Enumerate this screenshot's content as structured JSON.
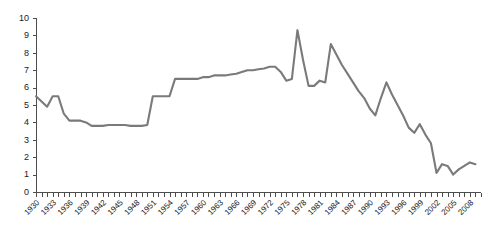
{
  "chart_data": {
    "type": "line",
    "title": "",
    "subtitle": "",
    "xlabel": "",
    "ylabel": "",
    "ylim": [
      0,
      10
    ],
    "xlim": [
      1930,
      2010
    ],
    "grid": false,
    "legend": null,
    "y_ticks": [
      0,
      1,
      2,
      3,
      4,
      5,
      6,
      7,
      8,
      9,
      10
    ],
    "x_tick_labels": [
      "1930",
      "1933",
      "1936",
      "1939",
      "1942",
      "1945",
      "1948",
      "1951",
      "1954",
      "1957",
      "1960",
      "1963",
      "1966",
      "1969",
      "1972",
      "1975",
      "1978",
      "1981",
      "1984",
      "1987",
      "1990",
      "1993",
      "1996",
      "1999",
      "2002",
      "2005",
      "2008"
    ],
    "x_tick_label_step": 3,
    "x_minor_tick_step": 1,
    "line_color": "#7a7a7a",
    "axis_color": "#4d4d4d",
    "series": [
      {
        "name": "series-1",
        "x": [
          1930,
          1931,
          1932,
          1933,
          1934,
          1935,
          1936,
          1937,
          1938,
          1939,
          1940,
          1941,
          1942,
          1943,
          1944,
          1945,
          1946,
          1947,
          1948,
          1949,
          1950,
          1951,
          1952,
          1953,
          1954,
          1955,
          1956,
          1957,
          1958,
          1959,
          1960,
          1961,
          1962,
          1963,
          1964,
          1965,
          1966,
          1967,
          1968,
          1969,
          1970,
          1971,
          1972,
          1973,
          1974,
          1975,
          1976,
          1977,
          1978,
          1979,
          1980,
          1981,
          1982,
          1983,
          1984,
          1985,
          1986,
          1987,
          1988,
          1989,
          1990,
          1991,
          1992,
          1993,
          1994,
          1995,
          1996,
          1997,
          1998,
          1999,
          2000,
          2001,
          2002,
          2003,
          2004,
          2005,
          2006,
          2007,
          2008,
          2009
        ],
        "values": [
          5.5,
          5.2,
          4.9,
          5.5,
          5.5,
          4.5,
          4.1,
          4.1,
          4.1,
          4.0,
          3.8,
          3.8,
          3.8,
          3.85,
          3.85,
          3.85,
          3.85,
          3.8,
          3.8,
          3.8,
          3.85,
          5.5,
          5.5,
          5.5,
          5.5,
          6.5,
          6.5,
          6.5,
          6.5,
          6.5,
          6.6,
          6.6,
          6.7,
          6.7,
          6.7,
          6.75,
          6.8,
          6.9,
          7.0,
          7.0,
          7.05,
          7.1,
          7.2,
          7.2,
          6.9,
          6.4,
          6.5,
          9.3,
          7.6,
          6.1,
          6.1,
          6.4,
          6.3,
          8.5,
          7.9,
          7.3,
          6.8,
          6.3,
          5.8,
          5.4,
          4.8,
          4.4,
          5.4,
          6.3,
          5.6,
          5.0,
          4.4,
          3.7,
          3.4,
          3.9,
          3.3,
          2.8,
          1.1,
          1.6,
          1.5,
          1.0,
          1.3,
          1.5,
          1.7,
          1.6
        ]
      }
    ]
  }
}
